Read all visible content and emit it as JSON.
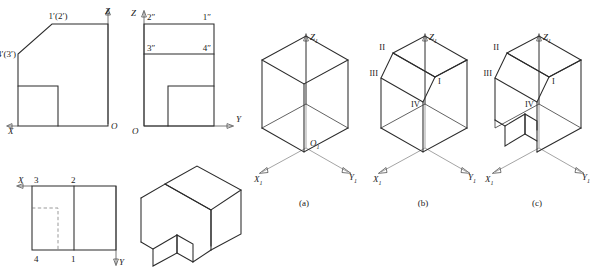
{
  "figure": {
    "kind": "engineering-orthographic-and-isometric-construction",
    "captions": [
      {
        "id": "a",
        "label": "(a)"
      },
      {
        "id": "b",
        "label": "(b)"
      },
      {
        "id": "c",
        "label": "(c)"
      }
    ]
  },
  "front_view": {
    "name": "front-view",
    "axis_x": "X",
    "axis_z": "Z",
    "origin": "O",
    "points": [
      {
        "label": "1′(2′)"
      },
      {
        "label": "4′(3′)"
      }
    ]
  },
  "side_view": {
    "name": "side-view",
    "axis_y": "Y",
    "axis_z": "Z",
    "origin": "O",
    "points": [
      {
        "label": "2″"
      },
      {
        "label": "1″"
      },
      {
        "label": "3″"
      },
      {
        "label": "4″"
      }
    ]
  },
  "top_view": {
    "name": "top-view",
    "axis_x": "X",
    "axis_y": "Y",
    "points": [
      {
        "label": "3"
      },
      {
        "label": "2"
      },
      {
        "label": "4"
      },
      {
        "label": "1"
      }
    ]
  },
  "solid_view": {
    "name": "finished-solid-isometric"
  },
  "step_a": {
    "name": "isometric-step-a-base-box",
    "axis_x": "X",
    "axis_z": "Z",
    "axis_y": "Y",
    "origin": "O",
    "axis_sub": "1",
    "origin_sub": "1"
  },
  "step_b": {
    "name": "isometric-step-b-chamfer",
    "axis_x": "X",
    "axis_z": "Z",
    "axis_y": "Y",
    "axis_sub": "1",
    "vertices": [
      {
        "label": "I"
      },
      {
        "label": "II"
      },
      {
        "label": "III"
      },
      {
        "label": "IV"
      }
    ]
  },
  "step_c": {
    "name": "isometric-step-c-notch",
    "axis_x": "X",
    "axis_z": "Z",
    "axis_y": "Y",
    "axis_sub": "1",
    "vertices": [
      {
        "label": "I"
      },
      {
        "label": "II"
      },
      {
        "label": "III"
      },
      {
        "label": "IV"
      }
    ]
  },
  "colors": {
    "line": "#2b2b2b",
    "axis": "#4a4a4a",
    "hidden": "#6e6e6e",
    "background": "#ffffff"
  }
}
